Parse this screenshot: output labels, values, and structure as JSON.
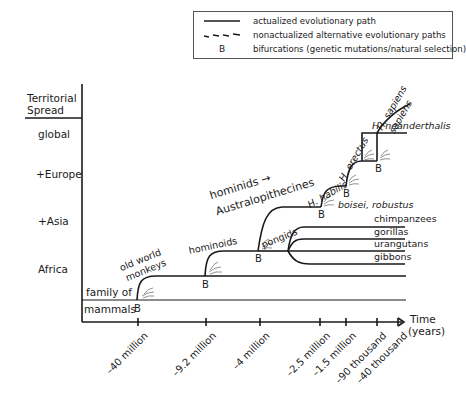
{
  "legend": {
    "items": [
      {
        "symbol": "solid-line",
        "label": "actualized evolutionary path"
      },
      {
        "symbol": "dashed-line",
        "label": "nonactualized alternative evolutionary paths"
      },
      {
        "symbol": "B",
        "label": "bifurcations (genetic mutations/natural selection)"
      }
    ]
  },
  "y_axis": {
    "title_line1": "Territorial",
    "title_line2": "Spread",
    "levels": [
      "global",
      "+Europe",
      "+Asia",
      "Africa"
    ]
  },
  "x_axis": {
    "title_line1": "Time",
    "title_line2": "(years)",
    "ticks": [
      "–40 million",
      "–9.2 million",
      "–4 million",
      "–2.5 million",
      "–1.5 million",
      "–90 thousand",
      "–40 thousand"
    ]
  },
  "trunk": {
    "label_line1": "family of",
    "label_line2": "mammals"
  },
  "branches": {
    "old_world_line1": "old world",
    "old_world_line2": "monkeys",
    "hominoids": "hominoids",
    "hominids_line1": "hominids →",
    "hominids_line2": "Australopithecines",
    "pongids": "pongids",
    "h_habilis": "H. habilis",
    "boisei": "boisei, robustus",
    "h_erectus": "H. erectus",
    "h_sapiens_line1": "H. sapiens",
    "h_sapiens_line2": "sapiens",
    "h_neanderthalis": "H. neanderthalis",
    "chimpanzees": "chimpanzees",
    "gorillas": "gorillas",
    "urangutans": "urangutans",
    "gibbons": "gibbons"
  },
  "bifurcation_marker": "B",
  "colors": {
    "line": "#1a1a1a",
    "hatch": "#777777",
    "border": "#555555"
  }
}
